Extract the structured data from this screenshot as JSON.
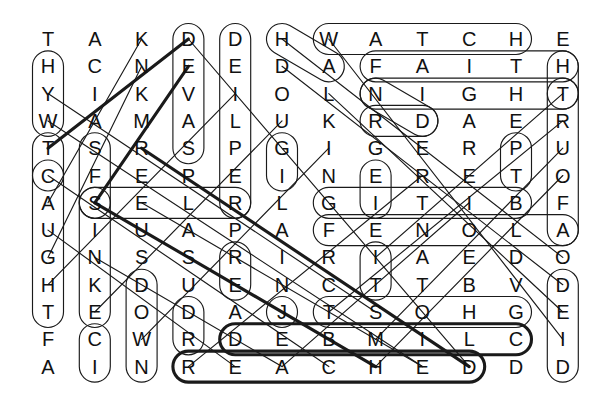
{
  "puzzle": {
    "type": "word-search",
    "rows": 13,
    "cols": 12,
    "grid": [
      [
        "T",
        "A",
        "K",
        "D",
        "D",
        "H",
        "W",
        "A",
        "T",
        "C",
        "H",
        "E"
      ],
      [
        "H",
        "C",
        "N",
        "E",
        "E",
        "D",
        "A",
        "F",
        "A",
        "I",
        "T",
        "H"
      ],
      [
        "Y",
        "I",
        "K",
        "V",
        "I",
        "O",
        "L",
        "N",
        "I",
        "G",
        "H",
        "T"
      ],
      [
        "W",
        "A",
        "M",
        "A",
        "L",
        "U",
        "K",
        "R",
        "D",
        "A",
        "E",
        "R"
      ],
      [
        "T",
        "S",
        "R",
        "S",
        "P",
        "G",
        "I",
        "G",
        "E",
        "R",
        "P",
        "U"
      ],
      [
        "C",
        "F",
        "E",
        "P",
        "E",
        "I",
        "N",
        "E",
        "R",
        "E",
        "T",
        "O"
      ],
      [
        "A",
        "S",
        "E",
        "L",
        "R",
        "L",
        "G",
        "I",
        "T",
        "I",
        "B",
        "F"
      ],
      [
        "U",
        "I",
        "U",
        "A",
        "P",
        "A",
        "F",
        "E",
        "N",
        "O",
        "L",
        "A"
      ],
      [
        "G",
        "N",
        "S",
        "S",
        "R",
        "I",
        "R",
        "I",
        "A",
        "E",
        "D",
        "O"
      ],
      [
        "H",
        "K",
        "D",
        "U",
        "E",
        "N",
        "C",
        "T",
        "T",
        "B",
        "V",
        "D"
      ],
      [
        "T",
        "E",
        "O",
        "D",
        "A",
        "J",
        "T",
        "S",
        "O",
        "H",
        "G",
        "E"
      ],
      [
        "F",
        "C",
        "W",
        "R",
        "D",
        "E",
        "B",
        "M",
        "I",
        "L",
        "C",
        "I"
      ],
      [
        "A",
        "I",
        "N",
        "R",
        "E",
        "A",
        "C",
        "H",
        "E",
        "D",
        "D",
        "D"
      ]
    ],
    "geometry": {
      "origin_x": 48,
      "origin_y": 39,
      "step_x": 46.8,
      "step_y": 27.3
    },
    "colors": {
      "ink": "#111111",
      "outline": "#1a1a1a",
      "background": "#ffffff"
    },
    "found_words": [
      {
        "text": "WATCH",
        "start": [
          0,
          6
        ],
        "end": [
          0,
          10
        ],
        "dir": "E",
        "weight": "thin"
      },
      {
        "text": "FAITH",
        "start": [
          1,
          7
        ],
        "end": [
          1,
          11
        ],
        "dir": "E",
        "weight": "thin"
      },
      {
        "text": "NIGHT",
        "start": [
          2,
          7
        ],
        "end": [
          2,
          11
        ],
        "dir": "E",
        "weight": "thin"
      },
      {
        "text": "HEADED",
        "start": [
          0,
          5
        ],
        "end": [
          3,
          8
        ],
        "dir": "SE",
        "weight": "thin"
      },
      {
        "text": "DEVASTATED",
        "start": [
          0,
          3
        ],
        "end": [
          12,
          3
        ],
        "dir": "S",
        "weight": "thin"
      },
      {
        "text": "DEILPER",
        "start": [
          0,
          4
        ],
        "end": [
          6,
          4
        ],
        "dir": "S",
        "weight": "thin"
      },
      {
        "text": "HYWTCA",
        "start": [
          1,
          0
        ],
        "end": [
          6,
          0
        ],
        "dir": "S",
        "weight": "thin"
      },
      {
        "text": "CAUGHT",
        "start": [
          5,
          0
        ],
        "end": [
          10,
          0
        ],
        "dir": "S",
        "weight": "thin"
      },
      {
        "text": "SINKE",
        "start": [
          6,
          1
        ],
        "end": [
          11,
          1
        ],
        "dir": "S",
        "weight": "thin"
      },
      {
        "text": "DOWN",
        "start": [
          9,
          2
        ],
        "end": [
          12,
          2
        ],
        "dir": "S",
        "weight": "thin"
      },
      {
        "text": "TRUOFA",
        "start": [
          2,
          11
        ],
        "end": [
          7,
          11
        ],
        "dir": "S",
        "weight": "thin"
      },
      {
        "text": "DEID",
        "start": [
          9,
          11
        ],
        "end": [
          12,
          11
        ],
        "dir": "S",
        "weight": "thin"
      },
      {
        "text": "REACHED",
        "start": [
          12,
          3
        ],
        "end": [
          12,
          9
        ],
        "dir": "E",
        "weight": "thick"
      },
      {
        "text": "DEBMILC",
        "start": [
          11,
          4
        ],
        "end": [
          11,
          10
        ],
        "dir": "E",
        "weight": "thick"
      },
      {
        "text": "TSOHG",
        "start": [
          10,
          6
        ],
        "end": [
          10,
          10
        ],
        "dir": "E",
        "weight": "thin"
      },
      {
        "text": "DEVASTATE",
        "start": [
          0,
          3
        ],
        "end": [
          9,
          3
        ],
        "dir": "S",
        "weight": "thin"
      },
      {
        "text": "FENOLA",
        "start": [
          7,
          6
        ],
        "end": [
          7,
          11
        ],
        "dir": "E",
        "weight": "thin"
      },
      {
        "text": "SELR",
        "start": [
          6,
          1
        ],
        "end": [
          6,
          4
        ],
        "dir": "E",
        "weight": "thin"
      },
      {
        "text": "GITIB",
        "start": [
          6,
          6
        ],
        "end": [
          6,
          10
        ],
        "dir": "E",
        "weight": "thin"
      },
      {
        "text": "DIAGONAL-1",
        "start": [
          0,
          3
        ],
        "end": [
          12,
          9
        ],
        "dir": "SE",
        "weight": "thick"
      },
      {
        "text": "DIAGONAL-2",
        "start": [
          3,
          0
        ],
        "end": [
          10,
          7
        ],
        "dir": "SE",
        "weight": "thick"
      },
      {
        "text": "DIAGONAL-3",
        "start": [
          6,
          1
        ],
        "end": [
          12,
          7
        ],
        "dir": "SE",
        "weight": "thick"
      }
    ]
  }
}
